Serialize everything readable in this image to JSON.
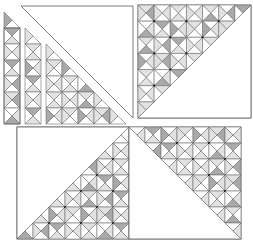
{
  "diagram": {
    "title": "",
    "cell_size": 16,
    "colors": {
      "line": "#6e6e6e",
      "white": "#ffffff",
      "light": "#e2e2e2",
      "dark": "#a9a9a9",
      "vertex": "#222222"
    },
    "shade_pattern": [
      "WLWL",
      "LWDW",
      "WLWL",
      "DWLW",
      "WLWD",
      "LWLW",
      "WDWL",
      "LWLW",
      "WLWD",
      "LDWL",
      "WLWL",
      "DWLW",
      "WLDW",
      "LWWL"
    ],
    "blocks": [
      {
        "id": "top-left",
        "x": 21,
        "y": 6,
        "size": 112,
        "white_half": "upper-right",
        "exploded": true
      },
      {
        "id": "top-right",
        "x": 138,
        "y": 5,
        "size": 113,
        "white_half": "lower-right",
        "exploded": false
      },
      {
        "id": "bottom-left",
        "x": 17,
        "y": 127,
        "size": 112,
        "white_half": "upper-left",
        "exploded": false
      },
      {
        "id": "bottom-right",
        "x": 129,
        "y": 127,
        "size": 112,
        "white_half": "lower-left",
        "exploded": false
      }
    ]
  }
}
